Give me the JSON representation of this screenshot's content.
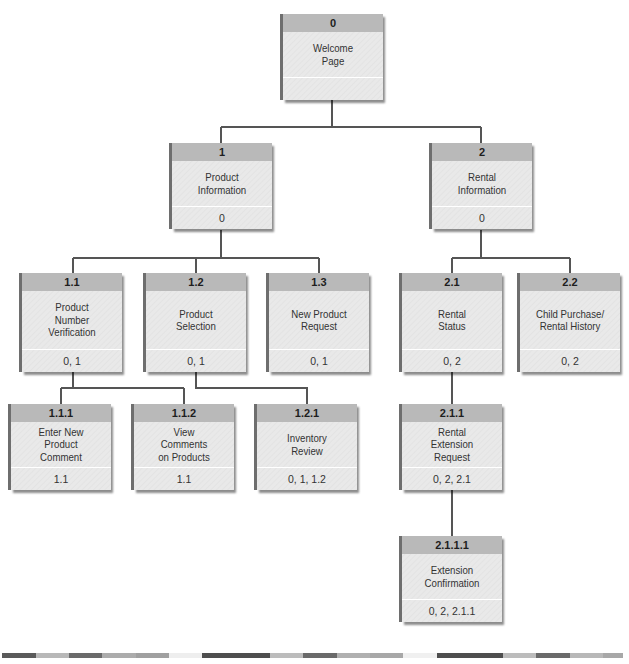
{
  "diagram": {
    "type": "hierarchy-chart",
    "nodes": [
      {
        "id": "0",
        "title": "Welcome\nPage",
        "parents": ""
      },
      {
        "id": "1",
        "title": "Product\nInformation",
        "parents": "0"
      },
      {
        "id": "2",
        "title": "Rental\nInformation",
        "parents": "0"
      },
      {
        "id": "1.1",
        "title": "Product\nNumber\nVerification",
        "parents": "0, 1"
      },
      {
        "id": "1.2",
        "title": "Product\nSelection",
        "parents": "0, 1"
      },
      {
        "id": "1.3",
        "title": "New Product\nRequest",
        "parents": "0, 1"
      },
      {
        "id": "2.1",
        "title": "Rental\nStatus",
        "parents": "0, 2"
      },
      {
        "id": "2.2",
        "title": "Child Purchase/\nRental History",
        "parents": "0, 2"
      },
      {
        "id": "1.1.1",
        "title": "Enter New\nProduct\nComment",
        "parents": "1.1"
      },
      {
        "id": "1.1.2",
        "title": "View\nComments\non Products",
        "parents": "1.1"
      },
      {
        "id": "1.2.1",
        "title": "Inventory\nReview",
        "parents": "0, 1, 1.2"
      },
      {
        "id": "2.1.1",
        "title": "Rental\nExtension\nRequest",
        "parents": "0, 2, 2.1"
      },
      {
        "id": "2.1.1.1",
        "title": "Extension\nConfirmation",
        "parents": "0, 2, 2.1.1"
      }
    ],
    "edges": [
      [
        "0",
        "1"
      ],
      [
        "0",
        "2"
      ],
      [
        "1",
        "1.1"
      ],
      [
        "1",
        "1.2"
      ],
      [
        "1",
        "1.3"
      ],
      [
        "2",
        "2.1"
      ],
      [
        "2",
        "2.2"
      ],
      [
        "1.1",
        "1.1.1"
      ],
      [
        "1.1",
        "1.1.2"
      ],
      [
        "1.2",
        "1.2.1"
      ],
      [
        "2.1",
        "2.1.1"
      ],
      [
        "2.1.1",
        "2.1.1.1"
      ]
    ],
    "colors": {
      "header": "#b9b9b9",
      "body": "#e9e9e9",
      "line": "#555555",
      "shadow": "#6e6e6e"
    }
  }
}
